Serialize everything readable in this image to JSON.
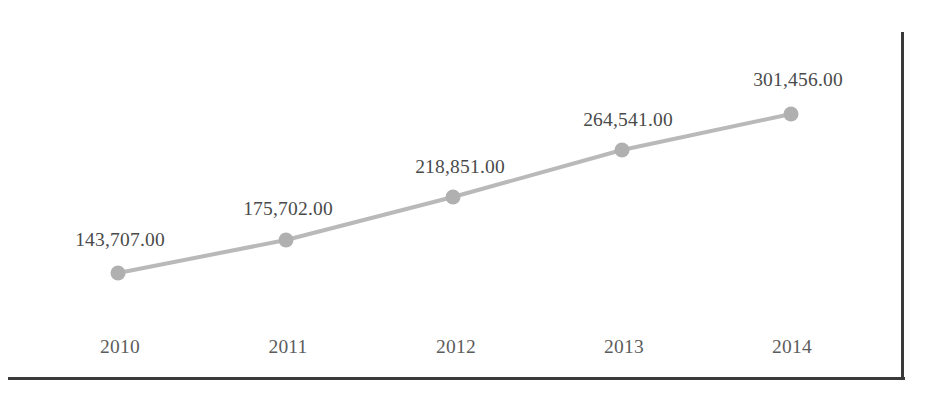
{
  "chart_data": {
    "type": "line",
    "title": "",
    "subtitle": "",
    "xlabel": "",
    "ylabel": "",
    "categories": [
      "2010",
      "2011",
      "2012",
      "2013",
      "2014"
    ],
    "values": [
      143707.0,
      175702.0,
      218851.0,
      264541.0,
      301456.0
    ],
    "data_labels": [
      "143,707.00",
      "175,702.00",
      "218,851.00",
      "264,541.00",
      "301,456.00"
    ],
    "series": [
      {
        "name": "",
        "values": [
          143707.0,
          175702.0,
          218851.0,
          264541.0,
          301456.0
        ]
      }
    ],
    "ylim": [
      0,
      320000
    ],
    "grid": false,
    "legend": false,
    "legend_position": "none",
    "marker": "circle",
    "line_color": "#b9b9b9",
    "marker_color": "#b0b0b0",
    "axis_color": "#3a3a3a",
    "label_color": "#4a4a4a",
    "tick_label_color": "#5c5c5c",
    "points_px": [
      {
        "x": 118,
        "y": 273
      },
      {
        "x": 286,
        "y": 240
      },
      {
        "x": 453,
        "y": 197
      },
      {
        "x": 622,
        "y": 150
      },
      {
        "x": 791,
        "y": 114
      }
    ],
    "data_label_positions_px": [
      {
        "x": 120,
        "y": 240
      },
      {
        "x": 288,
        "y": 209
      },
      {
        "x": 460,
        "y": 167
      },
      {
        "x": 628,
        "y": 120
      },
      {
        "x": 798,
        "y": 80
      }
    ],
    "category_label_positions_px": [
      {
        "x": 120,
        "y": 347
      },
      {
        "x": 288,
        "y": 347
      },
      {
        "x": 456,
        "y": 347
      },
      {
        "x": 624,
        "y": 347
      },
      {
        "x": 792,
        "y": 347
      }
    ]
  }
}
